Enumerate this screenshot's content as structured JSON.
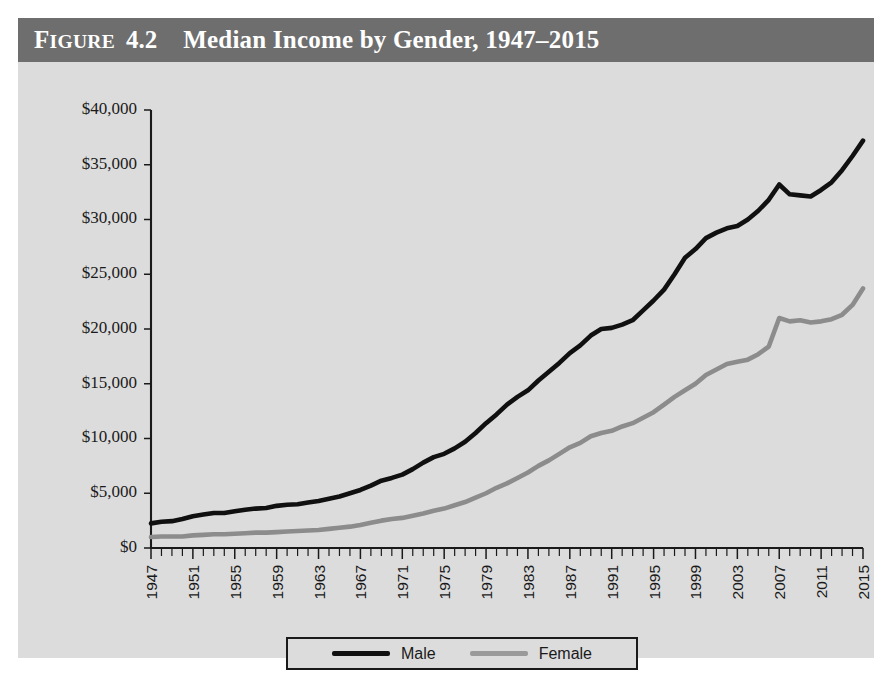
{
  "figure": {
    "label_prefix": "F",
    "label_rest": "IGURE",
    "number": "4.2",
    "title": "Median Income by Gender, 1947–2015",
    "title_bar_color": "#6e6e6e",
    "panel_color": "#dcdcdc"
  },
  "legend": {
    "position": "bottom-center",
    "entries": [
      {
        "label": "Male",
        "color": "#101010"
      },
      {
        "label": "Female",
        "color": "#9a9a9a"
      }
    ]
  },
  "chart_data": {
    "type": "line",
    "title": "Median Income by Gender, 1947–2015",
    "xlabel": "",
    "ylabel": "",
    "xlim": [
      1947,
      2015
    ],
    "ylim": [
      0,
      40000
    ],
    "grid": false,
    "legend_position": "bottom-center",
    "ytick_labels": [
      "$0",
      "$5,000",
      "$10,000",
      "$15,000",
      "$20,000",
      "$25,000",
      "$30,000",
      "$35,000",
      "$40,000"
    ],
    "ytick_values": [
      0,
      5000,
      10000,
      15000,
      20000,
      25000,
      30000,
      35000,
      40000
    ],
    "xtick_labels": [
      "1947",
      "1951",
      "1955",
      "1959",
      "1963",
      "1967",
      "1971",
      "1975",
      "1979",
      "1983",
      "1987",
      "1991",
      "1995",
      "1999",
      "2003",
      "2007",
      "2011",
      "2015"
    ],
    "xtick_values": [
      1947,
      1951,
      1955,
      1959,
      1963,
      1967,
      1971,
      1975,
      1979,
      1983,
      1987,
      1991,
      1995,
      1999,
      2003,
      2007,
      2011,
      2015
    ],
    "xtick_minor_interval": 1,
    "x": [
      1947,
      1948,
      1949,
      1950,
      1951,
      1952,
      1953,
      1954,
      1955,
      1956,
      1957,
      1958,
      1959,
      1960,
      1961,
      1962,
      1963,
      1964,
      1965,
      1966,
      1967,
      1968,
      1969,
      1970,
      1971,
      1972,
      1973,
      1974,
      1975,
      1976,
      1977,
      1978,
      1979,
      1980,
      1981,
      1982,
      1983,
      1984,
      1985,
      1986,
      1987,
      1988,
      1989,
      1990,
      1991,
      1992,
      1993,
      1994,
      1995,
      1996,
      1997,
      1998,
      1999,
      2000,
      2001,
      2002,
      2003,
      2004,
      2005,
      2006,
      2007,
      2008,
      2009,
      2010,
      2011,
      2012,
      2013,
      2014,
      2015
    ],
    "series": [
      {
        "name": "Male",
        "color": "#101010",
        "values": [
          2250,
          2400,
          2450,
          2650,
          2900,
          3050,
          3200,
          3200,
          3350,
          3500,
          3600,
          3650,
          3850,
          3950,
          4000,
          4150,
          4300,
          4500,
          4700,
          5000,
          5300,
          5700,
          6150,
          6400,
          6700,
          7200,
          7800,
          8300,
          8600,
          9100,
          9700,
          10500,
          11400,
          12200,
          13100,
          13800,
          14400,
          15300,
          16100,
          16900,
          17800,
          18500,
          19400,
          20000,
          20100,
          20400,
          20800,
          21700,
          22600,
          23600,
          25000,
          26500,
          27300,
          28300,
          28800,
          29200,
          29400,
          30000,
          30800,
          31800,
          33200,
          32300,
          32200,
          32100,
          32700,
          33400,
          34500,
          35800,
          37200
        ]
      },
      {
        "name": "Female",
        "color": "#9a9a9a",
        "values": [
          1000,
          1050,
          1050,
          1050,
          1150,
          1200,
          1250,
          1250,
          1300,
          1350,
          1400,
          1400,
          1450,
          1500,
          1550,
          1600,
          1650,
          1750,
          1850,
          1950,
          2100,
          2300,
          2500,
          2650,
          2750,
          2950,
          3150,
          3400,
          3600,
          3900,
          4200,
          4600,
          5000,
          5500,
          5900,
          6400,
          6900,
          7500,
          8000,
          8600,
          9200,
          9600,
          10200,
          10500,
          10700,
          11100,
          11400,
          11900,
          12400,
          13100,
          13800,
          14400,
          15000,
          15800,
          16300,
          16800,
          17000,
          17200,
          17700,
          18400,
          21000,
          20700,
          20800,
          20600,
          20700,
          20900,
          21300,
          22200,
          23700
        ]
      }
    ]
  }
}
